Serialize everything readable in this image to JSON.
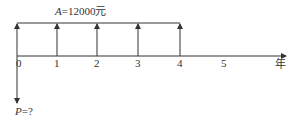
{
  "diagram": {
    "type": "cash-flow-timeline",
    "annuity_label": {
      "var": "A",
      "eq": "=12000",
      "unit": "元"
    },
    "present_value_label": {
      "var": "P",
      "eq": "=?"
    },
    "axis_unit": "年",
    "ticks": [
      "0",
      "1",
      "2",
      "3",
      "4",
      "5"
    ],
    "annuity_periods": [
      0,
      1,
      2,
      3,
      4
    ],
    "colors": {
      "line": "#333333",
      "background": "#ffffff"
    }
  }
}
